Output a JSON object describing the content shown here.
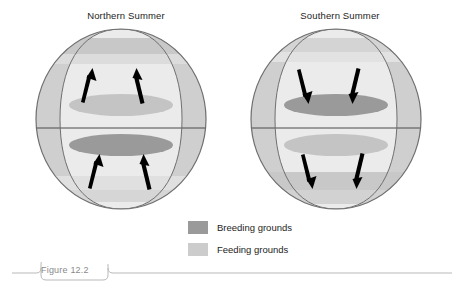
{
  "figure": {
    "caption_label": "Figure 12.2",
    "panels": [
      {
        "id": "northern",
        "title": "Northern Summer",
        "arrow_direction": "up",
        "arrow_meaning": "migration toward northern feeding grounds",
        "northern_ellipse": "feeding",
        "southern_ellipse": "breeding"
      },
      {
        "id": "southern",
        "title": "Southern Summer",
        "arrow_direction": "down",
        "arrow_meaning": "migration toward southern feeding grounds",
        "northern_ellipse": "breeding",
        "southern_ellipse": "feeding"
      }
    ]
  },
  "legend": {
    "items": [
      {
        "label": "Breeding grounds",
        "color": "#9a9a9a"
      },
      {
        "label": "Feeding grounds",
        "color": "#cccccc"
      }
    ]
  },
  "colors": {
    "globe_face": "#ebebeb",
    "globe_crescent": "#cfcfcf",
    "globe_outline": "#6f6f6f",
    "band_feeding": "#c8c8c8",
    "ellipse_breeding": "#9a9a9a",
    "ellipse_feeding": "#c4c4c4",
    "arrow": "#000000",
    "caption_rule": "#b9b9b9",
    "caption_text": "#8a8a8a",
    "background": "#ffffff"
  }
}
